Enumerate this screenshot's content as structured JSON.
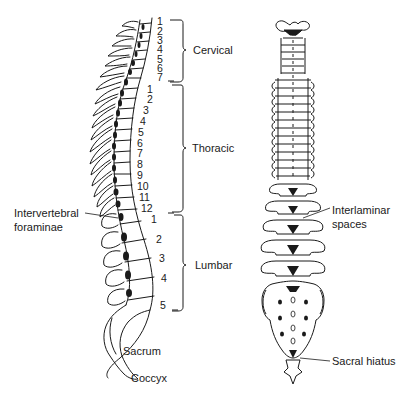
{
  "diagram": {
    "type": "anatomical-illustration",
    "views": [
      {
        "name": "lateral",
        "position": "left"
      },
      {
        "name": "posterior",
        "position": "right"
      }
    ]
  },
  "regions": {
    "cervical": {
      "label": "Cervical",
      "numbers": [
        "1",
        "2",
        "3",
        "4",
        "5",
        "6",
        "7"
      ]
    },
    "thoracic": {
      "label": "Thoracic",
      "numbers": [
        "1",
        "2",
        "3",
        "4",
        "5",
        "6",
        "7",
        "8",
        "9",
        "10",
        "11",
        "12"
      ]
    },
    "lumbar": {
      "label": "Lumbar",
      "numbers": [
        "1",
        "2",
        "3",
        "4",
        "5"
      ]
    }
  },
  "labels": {
    "intervertebral_line1": "Intervertebral",
    "intervertebral_line2": "foraminae",
    "sacrum": "Sacrum",
    "coccyx": "Coccyx",
    "interlaminar_line1": "Interlaminar",
    "interlaminar_line2": "spaces",
    "sacral_hiatus": "Sacral hiatus"
  },
  "colors": {
    "ink": "#1a1a1a",
    "background": "#ffffff"
  }
}
